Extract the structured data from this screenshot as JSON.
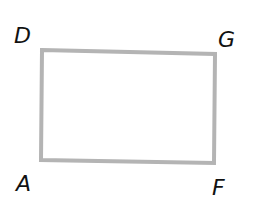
{
  "diagram": {
    "type": "rectangle",
    "stroke_color": "#b4b4b4",
    "stroke_width": 4,
    "vertices": [
      {
        "label": "D",
        "x": 42,
        "y": 50,
        "label_x": 14,
        "label_y": 43
      },
      {
        "label": "G",
        "x": 215,
        "y": 54,
        "label_x": 218,
        "label_y": 47
      },
      {
        "label": "F",
        "x": 214,
        "y": 163,
        "label_x": 212,
        "label_y": 195
      },
      {
        "label": "A",
        "x": 41,
        "y": 160,
        "label_x": 16,
        "label_y": 191
      }
    ]
  }
}
